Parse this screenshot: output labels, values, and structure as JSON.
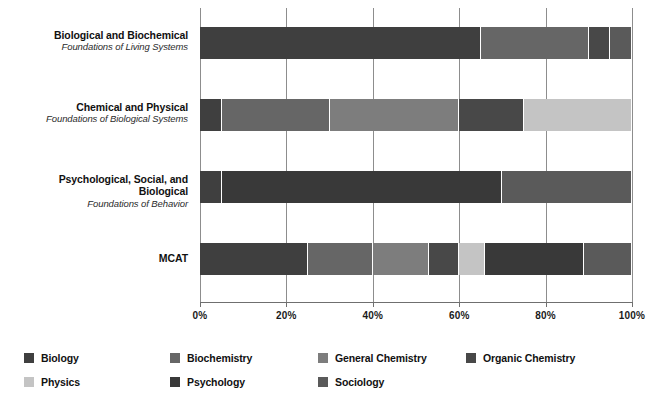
{
  "chart_data": {
    "type": "bar",
    "orientation": "horizontal",
    "stacked": true,
    "normalized": true,
    "title": "",
    "subtitle": "",
    "xlabel": "",
    "ylabel": "",
    "xlim": [
      0,
      100
    ],
    "xticks": [
      0,
      20,
      40,
      60,
      80,
      100
    ],
    "xticklabels": [
      "0%",
      "20%",
      "40%",
      "60%",
      "80%",
      "100%"
    ],
    "grid": true,
    "grid_axis": "x",
    "legend_position": "bottom",
    "categories": [
      {
        "line1": "Biological and Biochemical",
        "line2": "Foundations of Living Systems"
      },
      {
        "line1": "Chemical and Physical",
        "line2": "Foundations of Biological Systems"
      },
      {
        "line1": "Psychological, Social, and Biological",
        "line2": "Foundations of Behavior"
      },
      {
        "line1": "MCAT",
        "line2": ""
      }
    ],
    "series": [
      {
        "name": "Biology",
        "color": "#3f3f3f",
        "values": [
          65,
          5,
          5,
          25
        ]
      },
      {
        "name": "Biochemistry",
        "color": "#666666",
        "values": [
          25,
          25,
          0,
          15
        ]
      },
      {
        "name": "General Chemistry",
        "color": "#7d7d7d",
        "values": [
          0,
          30,
          0,
          13
        ]
      },
      {
        "name": "Organic Chemistry",
        "color": "#484848",
        "values": [
          5,
          15,
          0,
          7
        ]
      },
      {
        "name": "Physics",
        "color": "#c4c4c4",
        "values": [
          0,
          25,
          0,
          6
        ]
      },
      {
        "name": "Psychology",
        "color": "#393939",
        "values": [
          0,
          0,
          65,
          23
        ]
      },
      {
        "name": "Sociology",
        "color": "#5a5a5a",
        "values": [
          5,
          0,
          30,
          11
        ]
      }
    ],
    "legend_entries": [
      "Biology",
      "Biochemistry",
      "General Chemistry",
      "Organic Chemistry",
      "Physics",
      "Psychology",
      "Sociology"
    ]
  },
  "axis": {
    "tick_labels": [
      "0%",
      "20%",
      "40%",
      "60%",
      "80%",
      "100%"
    ]
  },
  "legend": {
    "items": [
      {
        "label": "Biology",
        "color": "#3f3f3f"
      },
      {
        "label": "Biochemistry",
        "color": "#666666"
      },
      {
        "label": "General Chemistry",
        "color": "#7d7d7d"
      },
      {
        "label": "Organic Chemistry",
        "color": "#484848"
      },
      {
        "label": "Physics",
        "color": "#c4c4c4"
      },
      {
        "label": "Psychology",
        "color": "#393939"
      },
      {
        "label": "Sociology",
        "color": "#5a5a5a"
      }
    ]
  }
}
